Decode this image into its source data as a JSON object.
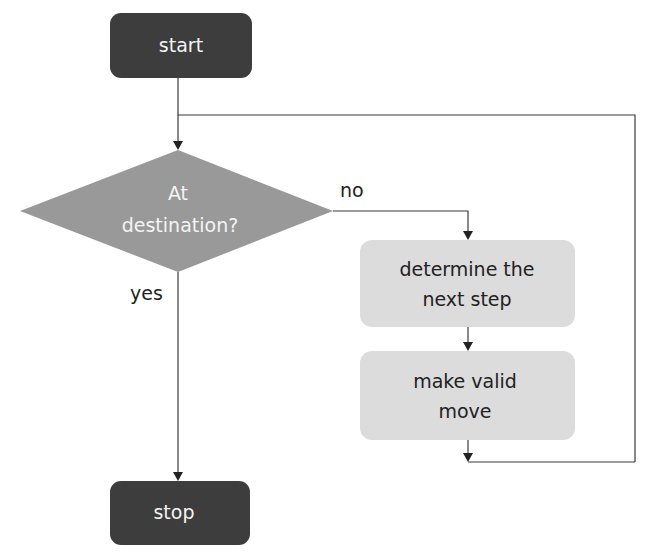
{
  "diagram": {
    "type": "flowchart",
    "colors": {
      "terminal_fill": "#3d3d3d",
      "decision_fill": "#999999",
      "process_fill": "#dcdcdc",
      "edge": "#3a3a3a",
      "light_text": "#f4f4f4",
      "dark_text": "#222222"
    },
    "nodes": {
      "start": {
        "kind": "terminal",
        "label": "start"
      },
      "decision": {
        "kind": "decision",
        "lines": [
          "At",
          "destination?"
        ]
      },
      "step1": {
        "kind": "process",
        "lines": [
          "determine the",
          "next step"
        ]
      },
      "step2": {
        "kind": "process",
        "lines": [
          "make valid",
          "move"
        ]
      },
      "stop": {
        "kind": "terminal",
        "label": "stop"
      }
    },
    "edges": {
      "no_label": "no",
      "yes_label": "yes"
    },
    "connections": [
      {
        "from": "start",
        "to": "decision"
      },
      {
        "from": "decision",
        "to": "step1",
        "label": "no"
      },
      {
        "from": "decision",
        "to": "stop",
        "label": "yes"
      },
      {
        "from": "step1",
        "to": "step2"
      },
      {
        "from": "step2",
        "to": "decision",
        "note": "loop back via right side"
      }
    ]
  }
}
